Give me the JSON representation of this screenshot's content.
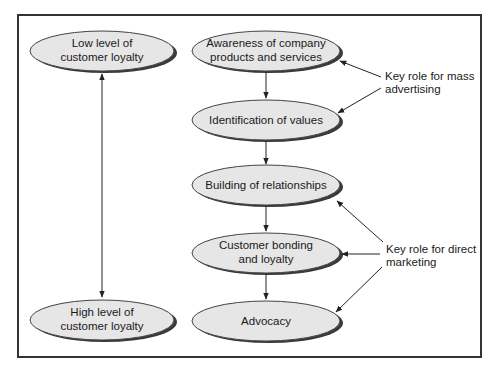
{
  "diagram": {
    "colors": {
      "frame": "#333333",
      "node_fill": "#e6e6e6",
      "node_stroke": "#444444",
      "node_shadow": "#3a3a3a",
      "arrow": "#222222",
      "text": "#1a1a1a"
    },
    "left_column": {
      "top_node": {
        "line1": "Low level of",
        "line2": "customer loyalty"
      },
      "bottom_node": {
        "line1": "High level of",
        "line2": "customer loyalty"
      }
    },
    "center_column": {
      "nodes": [
        {
          "line1": "Awareness of company",
          "line2": "products and services"
        },
        {
          "line1": "Identification of values",
          "line2": ""
        },
        {
          "line1": "Building of relationships",
          "line2": ""
        },
        {
          "line1": "Customer bonding",
          "line2": "and loyalty"
        },
        {
          "line1": "Advocacy",
          "line2": ""
        }
      ]
    },
    "annotations": {
      "mass_advertising": {
        "line1": "Key role for mass",
        "line2": "advertising"
      },
      "direct_marketing": {
        "line1": "Key role for direct",
        "line2": "marketing"
      }
    }
  }
}
